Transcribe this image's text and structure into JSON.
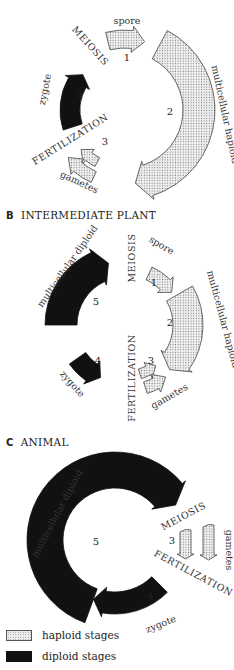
{
  "colors": {
    "haploid_fill": "#eeeeee",
    "haploid_dots": "#777777",
    "diploid_fill": "#111111",
    "stroke": "#444444"
  },
  "panels": [
    {
      "id": "A",
      "title": "",
      "stages": [
        {
          "number": "1",
          "label": "spore",
          "type": "haploid"
        },
        {
          "number": "2",
          "label": "multicellular haploid",
          "type": "haploid"
        },
        {
          "number": "3",
          "label": "gametes",
          "type": "haploid"
        },
        {
          "number": "4",
          "label": "zygote",
          "type": "diploid"
        }
      ],
      "events": [
        "MEIOSIS",
        "FERTILIZATION"
      ]
    },
    {
      "id": "B",
      "title": "INTERMEDIATE PLANT",
      "stages": [
        {
          "number": "1",
          "label": "spore",
          "type": "haploid"
        },
        {
          "number": "2",
          "label": "multicellular haploid",
          "type": "haploid"
        },
        {
          "number": "3",
          "label": "gametes",
          "type": "haploid"
        },
        {
          "number": "4",
          "label": "zygote",
          "type": "diploid"
        },
        {
          "number": "5",
          "label": "multicellular diploid",
          "type": "diploid"
        }
      ],
      "events": [
        "MEIOSIS",
        "FERTILIZATION"
      ]
    },
    {
      "id": "C",
      "title": "ANIMAL",
      "stages": [
        {
          "number": "3",
          "label": "gametes",
          "type": "haploid"
        },
        {
          "number": "4",
          "label": "zygote",
          "type": "diploid"
        },
        {
          "number": "5",
          "label": "multicellular diploid",
          "type": "diploid"
        }
      ],
      "events": [
        "MEIOSIS",
        "FERTILIZATION"
      ]
    }
  ],
  "legend": [
    {
      "label": "haploid stages",
      "type": "haploid"
    },
    {
      "label": "diploid stages",
      "type": "diploid"
    }
  ]
}
